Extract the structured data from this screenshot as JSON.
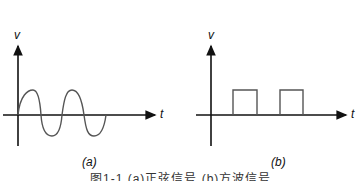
{
  "figure": {
    "panels": [
      {
        "id": "a",
        "label": "(a)",
        "y_axis": "v",
        "x_axis": "t",
        "waveform": "sine",
        "cycles": 2
      },
      {
        "id": "b",
        "label": "(b)",
        "y_axis": "v",
        "x_axis": "t",
        "waveform": "rectangular pulses",
        "pulses": 2
      }
    ],
    "caption": "图1-1 (a)正弦信号 (b)方波信号"
  }
}
